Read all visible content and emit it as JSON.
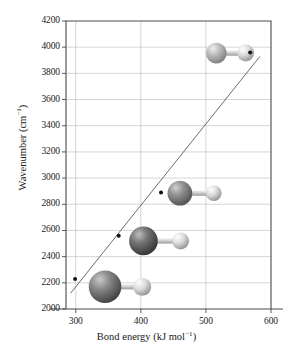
{
  "chart_data": {
    "type": "scatter",
    "title": "",
    "xlabel": "Bond energy (kJ mol⁻¹)",
    "ylabel": "Wavenumber (cm⁻¹)",
    "xlim": [
      285,
      600
    ],
    "ylim": [
      2000,
      4200
    ],
    "xticks": [
      300,
      400,
      500,
      600
    ],
    "yticks": [
      2000,
      2200,
      2400,
      2600,
      2800,
      3000,
      3200,
      3400,
      3600,
      3800,
      4000,
      4200
    ],
    "grid": true,
    "legend": "none",
    "x": [
      299,
      366,
      431,
      568
    ],
    "y": [
      2230,
      2560,
      2890,
      3960
    ],
    "point_labels": [
      "HI",
      "HBr",
      "HCl",
      "HF"
    ],
    "series": [
      {
        "name": "Hydrogen halides",
        "points": [
          {
            "label": "HI",
            "x": 299,
            "y": 2230
          },
          {
            "label": "HBr",
            "x": 366,
            "y": 2560
          },
          {
            "label": "HCl",
            "x": 431,
            "y": 2890
          },
          {
            "label": "HF",
            "x": 568,
            "y": 3960
          }
        ]
      }
    ],
    "trendline": {
      "x0": 292,
      "y0": 2120,
      "x1": 583,
      "y1": 3930
    },
    "molecules": [
      {
        "label": "HI",
        "cx": 345,
        "cy": 2170,
        "heavy_radius": 25,
        "heavy_color": "#6f6f6f",
        "h_offset": 57,
        "h_radius": 14,
        "h_color": "#d9d9d9"
      },
      {
        "label": "HBr",
        "cx": 404,
        "cy": 2520,
        "heavy_radius": 22,
        "heavy_color": "#5a5a5a",
        "h_offset": 57,
        "h_radius": 13,
        "h_color": "#dedede"
      },
      {
        "label": "HCl",
        "cx": 460,
        "cy": 2885,
        "heavy_radius": 19,
        "heavy_color": "#777777",
        "h_offset": 52,
        "h_radius": 12,
        "h_color": "#e2e2e2"
      },
      {
        "label": "HF",
        "cx": 516,
        "cy": 3955,
        "heavy_radius": 16,
        "heavy_color": "#a6a6a6",
        "h_offset": 45,
        "h_radius": 13,
        "h_color": "#d5d5d5"
      }
    ],
    "colors": {
      "axis": "#4a4a4a",
      "grid": "#b9b9b9",
      "trendline": "#5a5a5a",
      "marker": "#111111",
      "text": "#1a1a1a"
    }
  }
}
